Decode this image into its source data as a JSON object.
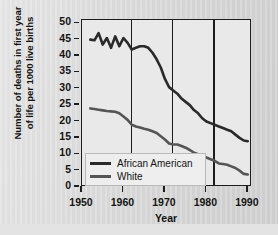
{
  "chart_data": {
    "type": "line",
    "title": "",
    "xlabel": "Year",
    "ylabel_line1": "Number of deaths in first year",
    "ylabel_line2": "of life per 1000 live births",
    "xlim": [
      1950,
      1991
    ],
    "ylim": [
      0,
      51
    ],
    "xticks": [
      1950,
      1960,
      1970,
      1980,
      1990
    ],
    "yticks": [
      0,
      5,
      10,
      15,
      20,
      25,
      30,
      35,
      40,
      45,
      50
    ],
    "grid": "vertical gridlines at 1960, 1970, 1980",
    "legend_position": "lower-left-inside",
    "series": [
      {
        "name": "African American",
        "color": "#2a2a2a",
        "x": [
          1952,
          1953,
          1954,
          1955,
          1956,
          1957,
          1958,
          1959,
          1960,
          1961,
          1962,
          1963,
          1964,
          1965,
          1966,
          1967,
          1968,
          1969,
          1970,
          1971,
          1972,
          1973,
          1974,
          1975,
          1976,
          1977,
          1978,
          1979,
          1980,
          1981,
          1982,
          1983,
          1984,
          1985,
          1986,
          1987,
          1988,
          1989,
          1990
        ],
        "values": [
          45,
          44.8,
          47,
          43.5,
          45.5,
          42.5,
          46,
          43,
          45.5,
          44,
          42,
          42.5,
          43,
          43,
          42.5,
          41,
          39,
          36.5,
          33,
          30.5,
          29.5,
          28.5,
          27,
          26,
          25,
          23.5,
          22.5,
          21,
          20,
          19.5,
          19,
          18.5,
          18,
          17.5,
          17,
          16,
          15,
          14.2,
          14
        ]
      },
      {
        "name": "White",
        "color": "#555555",
        "x": [
          1952,
          1953,
          1954,
          1955,
          1956,
          1957,
          1958,
          1959,
          1960,
          1961,
          1962,
          1963,
          1964,
          1965,
          1966,
          1967,
          1968,
          1969,
          1970,
          1971,
          1972,
          1973,
          1974,
          1975,
          1976,
          1977,
          1978,
          1979,
          1980,
          1981,
          1982,
          1983,
          1984,
          1985,
          1986,
          1987,
          1988,
          1989,
          1990
        ],
        "values": [
          24,
          23.8,
          23.6,
          23.4,
          23.2,
          23.1,
          23,
          22.5,
          21.5,
          20.5,
          19,
          18.5,
          18.2,
          17.8,
          17.5,
          17,
          16.5,
          15.5,
          14.5,
          13.3,
          13,
          13,
          12.5,
          12,
          11.3,
          10.5,
          10,
          9.5,
          9,
          8.5,
          8,
          7.2,
          7,
          6.8,
          6.3,
          5.8,
          5,
          4,
          3.8
        ]
      }
    ]
  },
  "axes": {
    "ytitle_line1": "Number of deaths in first year",
    "ytitle_line2": "of life per 1000 live births",
    "xtitle": "Year",
    "ylabels": [
      "50",
      "45",
      "40",
      "35",
      "30",
      "25",
      "20",
      "15",
      "10",
      "5",
      "0"
    ],
    "xlabels": [
      "1950",
      "1960",
      "1970",
      "1980",
      "1990"
    ]
  },
  "legend": {
    "items": [
      {
        "label": "African American",
        "color": "#2a2a2a"
      },
      {
        "label": "White",
        "color": "#555555"
      }
    ]
  }
}
